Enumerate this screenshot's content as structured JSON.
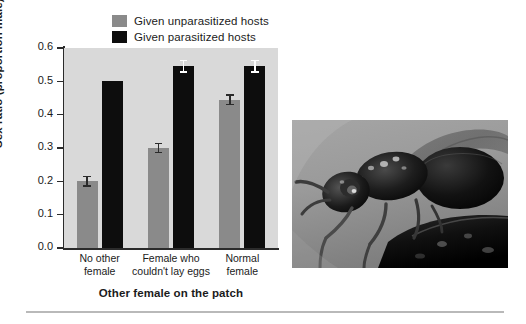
{
  "chart_data": {
    "type": "bar",
    "title": "",
    "xlabel": "Other female on the patch",
    "ylabel": "Sex ratio (proportion male)",
    "ylim": [
      0.0,
      0.6
    ],
    "ytick_values": [
      0.0,
      0.1,
      0.2,
      0.3,
      0.4,
      0.5,
      0.6
    ],
    "ytick_labels": [
      "0.0",
      "0.1",
      "0.2",
      "0.3",
      "0.4",
      "0.5",
      "0.6"
    ],
    "grid": false,
    "legend_position": "top-center",
    "categories": [
      "No other female",
      "Female who couldn't lay eggs",
      "Normal female"
    ],
    "category_lines": [
      [
        "No other",
        "female"
      ],
      [
        "Female who",
        "couldn't lay eggs"
      ],
      [
        "Normal",
        "female"
      ]
    ],
    "series": [
      {
        "name": "Given unparasitized hosts",
        "color": "#8a8a8a",
        "values": [
          0.2,
          0.3,
          0.445
        ],
        "errors": [
          0.017,
          0.016,
          0.017
        ],
        "errorbar_color": "#2b2b2b"
      },
      {
        "name": "Given parasitized hosts",
        "color": "#0d0d0d",
        "values": [
          0.5,
          0.545,
          0.545
        ],
        "errors": [
          0.0,
          0.02,
          0.02
        ],
        "errorbar_color": "#ffffff"
      }
    ],
    "plot_background": "#d9d9d9",
    "axis_color": "#2b2b2b"
  },
  "legend": {
    "items": [
      {
        "label": "Given unparasitized hosts",
        "color": "#8a8a8a"
      },
      {
        "label": "Given parasitized hosts",
        "color": "#0d0d0d"
      }
    ]
  },
  "photo": {
    "caption": "",
    "subject": "parasitoid-wasp-photograph"
  }
}
